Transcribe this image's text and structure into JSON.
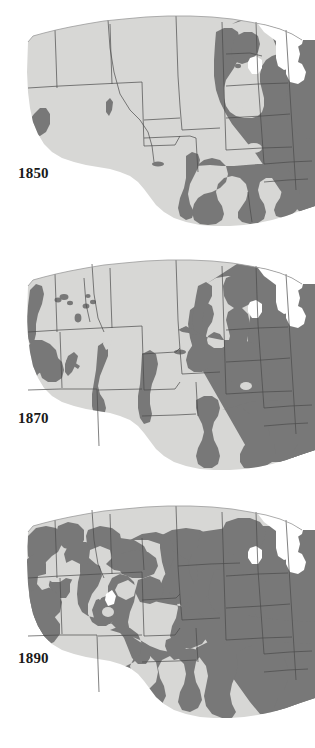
{
  "figure": {
    "kind": "map-series",
    "panels": [
      {
        "year_label": "1850",
        "label_position": {
          "x": 18,
          "y": 166
        },
        "panel_top": 6,
        "panel_height": 222
      },
      {
        "year_label": "1870",
        "label_position": {
          "x": 18,
          "y": 411
        },
        "panel_top": 250,
        "panel_height": 222
      },
      {
        "year_label": "1890",
        "label_position": {
          "x": 18,
          "y": 651
        },
        "panel_top": 492,
        "panel_height": 230
      }
    ]
  },
  "legend": {
    "settled_area_name": "settled area",
    "unsettled_area_name": "unsettled area",
    "water_name": "lakes and ocean"
  },
  "colors": {
    "settled": "#787878",
    "unsettled": "#d7d7d5",
    "water": "#ffffff",
    "page_background": "#ffffff",
    "state_boundary": "#4a4a4a",
    "coast_outline": "#9a9a9a",
    "label_text": "#1a1a1a"
  },
  "caption": {
    "text": ""
  }
}
